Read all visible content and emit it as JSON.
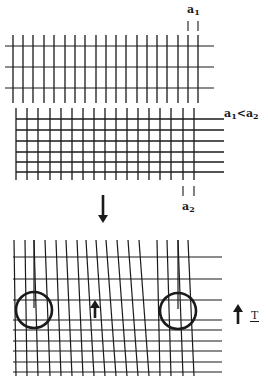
{
  "labels": {
    "a1_top": {
      "base": "a",
      "sub": "1"
    },
    "comparison": {
      "left_base": "a",
      "left_sub": "1",
      "op": "<",
      "right_base": "a",
      "right_sub": "2"
    },
    "a2_bottom": {
      "base": "a",
      "sub": "2"
    },
    "tension": "T"
  },
  "colors": {
    "line": "#1a1a1a",
    "background": "#ffffff"
  },
  "top_grid": {
    "vertical_x": [
      13,
      23,
      33,
      44,
      54,
      65,
      75,
      85,
      96,
      106,
      116,
      126,
      137,
      147,
      157,
      167,
      178,
      188,
      198
    ],
    "vertical_y": [
      35,
      103
    ],
    "horizontal_y": [
      46,
      67,
      88
    ],
    "horizontal_x": [
      5,
      214
    ],
    "spacing_marker_x": [
      188,
      198
    ],
    "spacing_marker_y": [
      21,
      31
    ]
  },
  "middle_grid": {
    "vertical_x": [
      16,
      27,
      38,
      50,
      61,
      72,
      83,
      94,
      105,
      116,
      127,
      138,
      149,
      160,
      171,
      183,
      194
    ],
    "vertical_y": [
      108,
      180
    ],
    "horizontal_y": [
      119,
      130,
      141,
      152,
      162,
      172
    ],
    "horizontal_x": [
      16,
      224
    ],
    "spacing_marker_x": [
      183,
      194
    ],
    "spacing_marker_y": [
      186,
      196
    ]
  },
  "transition_arrow": {
    "x": 103,
    "y1": 195,
    "y2": 223,
    "direction": "down"
  },
  "bottom_grid": {
    "horizontal_y": [
      257,
      279,
      300,
      320,
      330,
      341,
      351,
      362,
      372
    ],
    "horizontal_x": [
      13,
      222
    ],
    "vertical_bottom_x": [
      16,
      27,
      38,
      50,
      61,
      72,
      83,
      94,
      105,
      116,
      127,
      138,
      149,
      160,
      171,
      183,
      194
    ],
    "vertical_top_x": [
      14,
      25,
      34,
      45,
      56,
      66,
      77,
      86,
      96,
      106,
      117,
      128,
      139,
      157,
      167,
      178,
      188
    ],
    "vertical_y": [
      240,
      376
    ],
    "circles": [
      {
        "cx": 34,
        "cy": 310,
        "r": 18
      },
      {
        "cx": 178,
        "cy": 311,
        "r": 18
      }
    ],
    "inner_arrow": {
      "x": 95,
      "y1": 318,
      "y2": 300,
      "direction": "up"
    },
    "side_arrow": {
      "x": 238,
      "y1": 324,
      "y2": 304,
      "direction": "up"
    }
  }
}
